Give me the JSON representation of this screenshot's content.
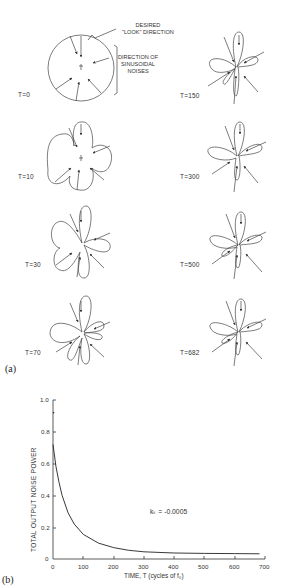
{
  "figure": {
    "panel_a_label": "(a)",
    "panel_b_label": "(b)",
    "annotations": {
      "look_direction_line1": "DESIRED",
      "look_direction_line2": "\"LOOK\" DIRECTION",
      "noise_line1": "DIRECTION OF",
      "noise_line2": "SINUSOIDAL",
      "noise_line3": "NOISES"
    },
    "patterns": [
      {
        "label": "T=0"
      },
      {
        "label": "T=10"
      },
      {
        "label": "T=30"
      },
      {
        "label": "T=70"
      },
      {
        "label": "T=150"
      },
      {
        "label": "T=300"
      },
      {
        "label": "T=500"
      },
      {
        "label": "T=682"
      }
    ]
  },
  "chart_data": {
    "type": "line",
    "title": "",
    "xlabel": "TIME, T (cycles of f₀)",
    "ylabel": "TOTAL OUTPUT NOISE POWER",
    "xlim": [
      0,
      700
    ],
    "ylim": [
      0,
      1.0
    ],
    "x_ticks": [
      "0",
      "100",
      "200",
      "300",
      "400",
      "500",
      "600",
      "700"
    ],
    "y_ticks": [
      "0",
      "0.2",
      "0.4",
      "0.6",
      "0.8",
      "1.0"
    ],
    "annotation": "kₛ = -0.0005",
    "grid": false,
    "series": [
      {
        "name": "Total output noise power",
        "x": [
          0,
          10,
          20,
          30,
          50,
          70,
          100,
          150,
          200,
          250,
          300,
          400,
          500,
          600,
          682
        ],
        "y": [
          0.72,
          0.58,
          0.48,
          0.4,
          0.29,
          0.22,
          0.155,
          0.1,
          0.072,
          0.055,
          0.045,
          0.038,
          0.035,
          0.034,
          0.033
        ]
      }
    ],
    "extra_points": [
      {
        "x": 2,
        "y": 0.92
      }
    ]
  }
}
